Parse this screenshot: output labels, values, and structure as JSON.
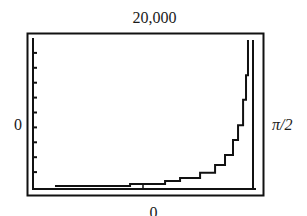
{
  "window": {
    "ymax_label": "20,000",
    "ymin_label": "0",
    "xmin_label": "0",
    "xmax_label": "π/2"
  },
  "colors": {
    "line": "#111111",
    "background": "#ffffff"
  },
  "chart_data": {
    "type": "line",
    "title": "",
    "xlabel": "",
    "ylabel": "",
    "xlim": [
      0,
      1.5708
    ],
    "ylim": [
      0,
      20000
    ],
    "x_tick_labels": [
      "0",
      "π/2"
    ],
    "y_tick_labels": [
      "0",
      "20,000"
    ],
    "y_tick_marks": 10,
    "grid": false,
    "legend": null,
    "plot_style": "graphing-calculator step plot with vertical asymptote near x = π/2",
    "series": [
      {
        "name": "curve",
        "x": [
          0.157,
          0.443,
          0.693,
          0.943,
          1.05,
          1.193,
          1.3,
          1.371,
          1.428,
          1.464,
          1.5,
          1.521,
          1.535
        ],
        "y": [
          150,
          150,
          400,
          800,
          1200,
          1900,
          2950,
          4300,
          6300,
          8300,
          11700,
          15000,
          19500
        ]
      }
    ],
    "annotations": [
      {
        "type": "vertical-line",
        "x": 1.5708,
        "note": "asymptote at π/2"
      }
    ]
  }
}
